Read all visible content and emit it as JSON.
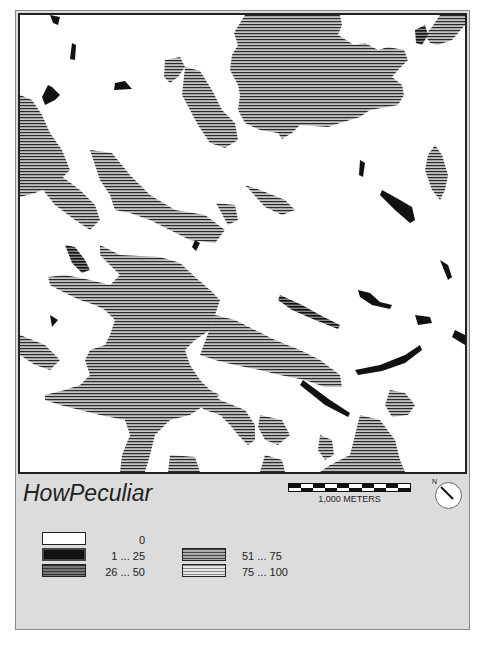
{
  "map": {
    "title": "HowPeculiar",
    "scale_bar": {
      "label": "1,000 METERS",
      "segments": 10
    },
    "north_arrow": {
      "label": "N"
    },
    "colors": {
      "background": "#ffffff",
      "panel": "#dcdcdc",
      "hatch_line": "#333333",
      "hatch_fill": "#b0b0b0",
      "dark": "#111111"
    }
  },
  "legend": {
    "items": [
      {
        "label": "0",
        "style": "white"
      },
      {
        "label": "1 ...  25",
        "style": "black"
      },
      {
        "label": "26 ...  50",
        "style": "dark-hatch"
      },
      {
        "label": "51 ...  75",
        "style": "medium-hatch"
      },
      {
        "label": "75 ... 100",
        "style": "light-hatch"
      }
    ]
  }
}
